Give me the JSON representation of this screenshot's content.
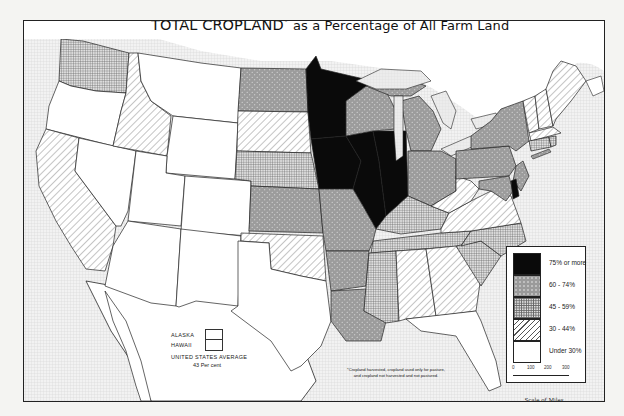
{
  "title": {
    "main": "TOTAL CROPLAND",
    "asterisk": "*",
    "rest": "as a Percentage of All Farm Land"
  },
  "legend": {
    "items": [
      {
        "label": "75% or more",
        "pattern": "solid-black",
        "color": "#0a0a0a"
      },
      {
        "label": "60 - 74%",
        "pattern": "dotted-gray",
        "color": "#9a9a9a"
      },
      {
        "label": "45 - 59%",
        "pattern": "crosshatch-grid",
        "color": "#bdbdbd"
      },
      {
        "label": "30 - 44%",
        "pattern": "diagonal-hatch",
        "color": "#ffffff"
      },
      {
        "label": "Under 30%",
        "pattern": "blank",
        "color": "#ffffff"
      }
    ]
  },
  "scale": {
    "ticks": [
      "0",
      "100",
      "200",
      "300"
    ],
    "label": "Scale of Miles"
  },
  "inset": {
    "alaska_label": "ALASKA",
    "hawaii_label": "HAWAII",
    "average_label": "UNITED STATES AVERAGE",
    "average_value": "43 Per cent"
  },
  "footnote": {
    "line1": "*Cropland harvested, cropland used only for pasture,",
    "line2": "and cropland not harvested and not pastured."
  },
  "states": {
    "75_or_more": [
      "Minnesota",
      "Iowa",
      "Illinois",
      "Indiana",
      "Delaware"
    ],
    "60_74": [
      "North Dakota",
      "Wisconsin",
      "Michigan",
      "Ohio",
      "New York",
      "Pennsylvania",
      "New Jersey",
      "Kansas",
      "Missouri",
      "Arkansas",
      "Louisiana",
      "Maryland"
    ],
    "45_59": [
      "Washington",
      "Nebraska",
      "Kentucky",
      "Tennessee",
      "Mississippi",
      "North Carolina",
      "South Carolina",
      "Connecticut",
      "Rhode Island"
    ],
    "30_44": [
      "California",
      "Idaho",
      "South Dakota",
      "Oklahoma",
      "Alabama",
      "Georgia",
      "Virginia",
      "West Virginia",
      "Vermont",
      "New Hampshire",
      "Maine",
      "Massachusetts"
    ],
    "under_30": [
      "Oregon",
      "Nevada",
      "Utah",
      "Arizona",
      "Montana",
      "Wyoming",
      "Colorado",
      "New Mexico",
      "Texas",
      "Florida",
      "Alaska",
      "Hawaii"
    ]
  }
}
